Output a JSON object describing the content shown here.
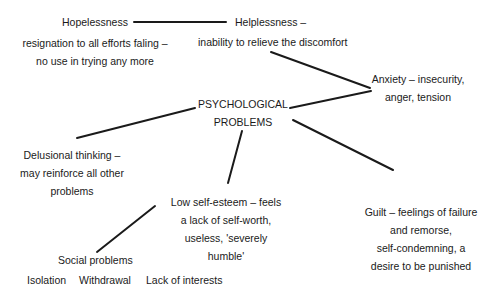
{
  "diagram": {
    "center": {
      "lines": [
        "PSYCHOLOGICAL",
        "PROBLEMS"
      ]
    },
    "hopelessness": {
      "title": "Hopelessness",
      "description": [
        "resignation to all efforts faling –",
        "no use in trying any more"
      ]
    },
    "helplessness": {
      "title": "Helplessness –",
      "description": "inability to relieve the discomfort"
    },
    "anxiety": {
      "lines": [
        "Anxiety – insecurity,",
        "anger, tension"
      ]
    },
    "delusional": {
      "lines": [
        "Delusional thinking –",
        "may reinforce all other",
        "problems"
      ]
    },
    "low_self_esteem": {
      "lines": [
        "Low self-esteem – feels",
        "a lack of self-worth,",
        "useless, 'severely",
        "humble'"
      ]
    },
    "guilt": {
      "lines": [
        "Guilt – feelings of failure",
        "and remorse,",
        "self-condemning, a",
        "desire to be punished"
      ]
    },
    "social": {
      "title": "Social problems",
      "items": [
        "Isolation",
        "Withdrawal",
        "Lack of interests"
      ]
    }
  }
}
